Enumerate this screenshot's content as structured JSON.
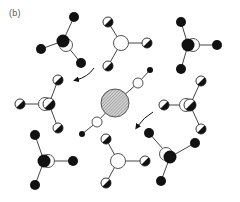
{
  "figure": {
    "panel_label": "(b)",
    "colors": {
      "ink": "#111111",
      "bond": "#444444",
      "background": "#ffffff",
      "hatch": "#999999",
      "label": "#555555"
    }
  },
  "central_ion": {
    "center": [
      115,
      103
    ],
    "radius": 14,
    "fill": "hatched",
    "chain": [
      {
        "type": "open",
        "pos": [
          138,
          83
        ],
        "r": 5
      },
      {
        "type": "small-filled",
        "pos": [
          150,
          70
        ],
        "r": 3
      },
      {
        "type": "open",
        "pos": [
          97,
          122
        ],
        "r": 5
      },
      {
        "type": "small-filled",
        "pos": [
          82,
          134
        ],
        "r": 3
      }
    ]
  },
  "molecules": [
    {
      "id": "top-left",
      "kind": "filled",
      "center": [
        63,
        41
      ],
      "ring": [
        66,
        45
      ],
      "arms": [
        [
          74,
          17
        ],
        [
          41,
          49
        ],
        [
          81,
          63
        ]
      ]
    },
    {
      "id": "top-middle",
      "kind": "open",
      "center": [
        121,
        43
      ],
      "arms": [
        [
          108,
          22
        ],
        [
          147,
          43
        ],
        [
          108,
          66
        ]
      ]
    },
    {
      "id": "top-right",
      "kind": "filled",
      "center": [
        188,
        45
      ],
      "ring": [
        193,
        45
      ],
      "arms": [
        [
          181,
          22
        ],
        [
          217,
          45
        ],
        [
          181,
          69
        ]
      ]
    },
    {
      "id": "mid-left",
      "kind": "half",
      "center": [
        49,
        104
      ],
      "ring": [
        45,
        104
      ],
      "arms": [
        [
          58,
          80
        ],
        [
          20,
          104
        ],
        [
          58,
          128
        ]
      ]
    },
    {
      "id": "mid-right",
      "kind": "half",
      "center": [
        190,
        105
      ],
      "ring": [
        186,
        105
      ],
      "arms": [
        [
          201,
          81
        ],
        [
          164,
          105
        ],
        [
          201,
          129
        ]
      ]
    },
    {
      "id": "bottom-left",
      "kind": "filled",
      "center": [
        44,
        161
      ],
      "ring": [
        48,
        161
      ],
      "arms": [
        [
          35,
          135
        ],
        [
          73,
          161
        ],
        [
          35,
          185
        ]
      ]
    },
    {
      "id": "bottom-middle",
      "kind": "open",
      "center": [
        118,
        161
      ],
      "arms": [
        [
          106,
          139
        ],
        [
          145,
          161
        ],
        [
          106,
          183
        ]
      ]
    },
    {
      "id": "bottom-right",
      "kind": "filled",
      "center": [
        170,
        157
      ],
      "ring": [
        166,
        154
      ],
      "arms": [
        [
          149,
          133
        ],
        [
          195,
          143
        ],
        [
          161,
          181
        ]
      ]
    }
  ],
  "arrows": [
    {
      "id": "rotation-arrow-upper",
      "path": "M94 68 Q88 77 76 80",
      "head": [
        76,
        80
      ]
    },
    {
      "id": "rotation-arrow-lower",
      "path": "M153 112 Q144 117 137 127",
      "head": [
        137,
        127
      ]
    }
  ]
}
